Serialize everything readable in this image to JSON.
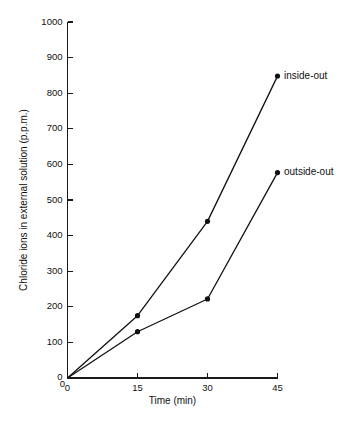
{
  "chart_data": {
    "type": "line",
    "title": "",
    "xlabel": "Time (min)",
    "ylabel": "Chloride ions in external solution (p.p.m.)",
    "xlim": [
      0,
      45
    ],
    "ylim": [
      0,
      1000
    ],
    "xticks": [
      0,
      15,
      30,
      45
    ],
    "xtick_labels": [
      "0",
      "15",
      "30",
      "45"
    ],
    "yticks": [
      0,
      100,
      200,
      300,
      400,
      500,
      600,
      700,
      800,
      900,
      1000
    ],
    "ytick_labels": [
      "0",
      "100",
      "200",
      "300",
      "400",
      "500",
      "600",
      "700",
      "800",
      "900",
      "1000"
    ],
    "grid": false,
    "legend_position": "inline-right-of-endpoint",
    "x": [
      0,
      15,
      30,
      45
    ],
    "series": [
      {
        "name": "inside-out",
        "label": "inside-out",
        "color": "#111111",
        "values": [
          0,
          175,
          440,
          848
        ],
        "label_x": 45,
        "label_y": 848
      },
      {
        "name": "outside-out",
        "label": "outside-out",
        "color": "#111111",
        "values": [
          0,
          130,
          222,
          577
        ],
        "label_x": 45,
        "label_y": 577
      }
    ],
    "origin_label": "0"
  }
}
